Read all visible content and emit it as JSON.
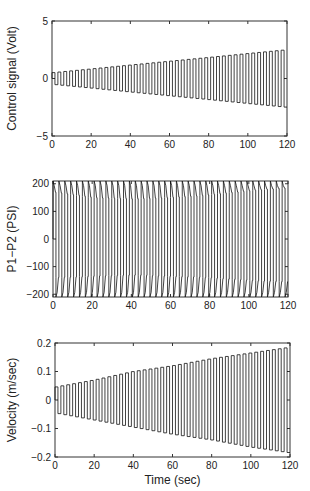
{
  "chart_data": [
    {
      "type": "line",
      "title": "",
      "xlabel": "",
      "ylabel": "Control signal (Volt)",
      "xlim": [
        0,
        120
      ],
      "ylim": [
        -5,
        5
      ],
      "xticks": [
        0,
        20,
        40,
        60,
        80,
        100,
        120
      ],
      "yticks": [
        -5,
        0,
        5
      ],
      "grid": false,
      "legend": null,
      "description": "Square wave with linearly increasing amplitude, period ~3 s (40 cycles)",
      "series": [
        {
          "name": "control signal",
          "period_sec": 3,
          "amplitude_start": 0.5,
          "amplitude_end": 2.5,
          "x": [
            0,
            20,
            40,
            60,
            80,
            100,
            120
          ],
          "upper": [
            0.5,
            0.83,
            1.17,
            1.5,
            1.83,
            2.17,
            2.5
          ],
          "lower": [
            -0.5,
            -0.83,
            -1.17,
            -1.5,
            -1.83,
            -2.17,
            -2.5
          ]
        }
      ],
      "frame": {
        "x": 52,
        "y": 21,
        "w": 235,
        "h": 115
      }
    },
    {
      "type": "line",
      "title": "",
      "xlabel": "",
      "ylabel": "P1−P2 (PSI)",
      "xlim": [
        0,
        120
      ],
      "ylim": [
        -210,
        210
      ],
      "xticks": [
        0,
        20,
        40,
        60,
        80,
        100,
        120
      ],
      "yticks": [
        -200,
        -100,
        0,
        100,
        200
      ],
      "grid": false,
      "legend": null,
      "description": "Pressure difference square-like wave with spikes at each switch, period ~3 s",
      "series": [
        {
          "name": "pressure difference",
          "period_sec": 3,
          "x": [
            0,
            20,
            40,
            60,
            80,
            100,
            120
          ],
          "upper": [
            170,
            150,
            145,
            150,
            160,
            175,
            185
          ],
          "lower": [
            -140,
            -135,
            -130,
            -135,
            -140,
            -150,
            -155
          ],
          "spike_peak": 210
        }
      ],
      "frame": {
        "x": 53,
        "y": 181,
        "w": 235,
        "h": 116
      }
    },
    {
      "type": "line",
      "title": "",
      "xlabel": "Time (sec)",
      "ylabel": "Velocity (m/sec)",
      "xlim": [
        0,
        120
      ],
      "ylim": [
        -0.2,
        0.2
      ],
      "xticks": [
        0,
        20,
        40,
        60,
        80,
        100,
        120
      ],
      "yticks": [
        -0.2,
        -0.1,
        0,
        0.1,
        0.2
      ],
      "grid": false,
      "legend": null,
      "description": "Velocity square wave with linearly increasing amplitude, period ~3 s",
      "series": [
        {
          "name": "velocity",
          "period_sec": 3,
          "x": [
            0,
            20,
            40,
            60,
            80,
            100,
            120
          ],
          "upper": [
            0.045,
            0.07,
            0.1,
            0.12,
            0.145,
            0.165,
            0.185
          ],
          "lower": [
            -0.045,
            -0.07,
            -0.095,
            -0.12,
            -0.14,
            -0.165,
            -0.185
          ]
        }
      ],
      "frame": {
        "x": 55,
        "y": 343,
        "w": 235,
        "h": 114
      }
    }
  ]
}
